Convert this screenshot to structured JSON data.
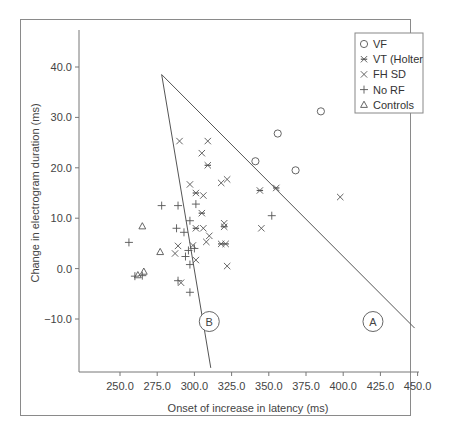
{
  "chart_data": {
    "type": "scatter",
    "title": "",
    "xlabel": "Onset of increase in latency (ms)",
    "ylabel": "Change in electrogram duration (ms)",
    "xlim": [
      222.5,
      450
    ],
    "ylim": [
      -20,
      47
    ],
    "x_ticks": [
      "250.0",
      "275.0",
      "300.0",
      "325.0",
      "350.0",
      "375.0",
      "400.0",
      "425.0",
      "450.0"
    ],
    "y_ticks": [
      "40.0",
      "30.0",
      "20.0",
      "10.0",
      "0.0",
      "-10.0"
    ],
    "grid": false,
    "legend_position": "upper right",
    "legend": [
      "VF",
      "VT (Holter",
      "FH SD",
      "No RF",
      "Controls"
    ],
    "series": [
      {
        "name": "VF",
        "marker": "circle",
        "points": [
          [
            341,
            21.3
          ],
          [
            356,
            26.8
          ],
          [
            368,
            19.5
          ],
          [
            385,
            31.2
          ]
        ]
      },
      {
        "name": "VT (Holter",
        "marker": "asterisk-x",
        "points": [
          [
            309,
            20.5
          ],
          [
            301,
            15.0
          ],
          [
            305,
            11.0
          ],
          [
            301,
            8.0
          ],
          [
            320,
            8.3
          ],
          [
            318,
            4.9
          ],
          [
            321,
            4.9
          ],
          [
            344,
            15.5
          ],
          [
            355,
            16.0
          ]
        ]
      },
      {
        "name": "FH SD",
        "marker": "x",
        "points": [
          [
            290,
            25.3
          ],
          [
            309,
            25.3
          ],
          [
            305,
            22.9
          ],
          [
            297,
            16.7
          ],
          [
            306,
            14.5
          ],
          [
            318,
            17.0
          ],
          [
            322,
            17.7
          ],
          [
            289,
            4.5
          ],
          [
            287,
            3.0
          ],
          [
            291,
            -2.8
          ],
          [
            299,
            4.6
          ],
          [
            301,
            1.7
          ],
          [
            308,
            5.3
          ],
          [
            310,
            6.5
          ],
          [
            320,
            9.0
          ],
          [
            322,
            0.5
          ],
          [
            345,
            8.0
          ],
          [
            398,
            14.2
          ],
          [
            306,
            8.0
          ]
        ]
      },
      {
        "name": "No RF",
        "marker": "plus",
        "points": [
          [
            256,
            5.2
          ],
          [
            260,
            -1.5
          ],
          [
            278,
            12.5
          ],
          [
            289,
            12.5
          ],
          [
            293,
            7.2
          ],
          [
            288,
            8.0
          ],
          [
            297,
            9.5
          ],
          [
            296,
            3.6
          ],
          [
            294,
            2.4
          ],
          [
            297,
            0.8
          ],
          [
            300,
            4.0
          ],
          [
            289,
            -2.4
          ],
          [
            297,
            -4.7
          ],
          [
            265,
            -1.4
          ],
          [
            352,
            10.5
          ],
          [
            301,
            12.8
          ]
        ]
      },
      {
        "name": "Controls",
        "marker": "triangle",
        "points": [
          [
            265,
            8.4
          ],
          [
            277,
            3.3
          ],
          [
            262,
            -1.3
          ],
          [
            266,
            -0.6
          ]
        ]
      }
    ],
    "lines": [
      {
        "name": "A",
        "from": [
          278,
          38.5
        ],
        "to": [
          448,
          -11.8
        ]
      },
      {
        "name": "B",
        "from": [
          278,
          38.5
        ],
        "to": [
          311,
          -19.7
        ]
      }
    ],
    "annotations": [
      {
        "label": "A",
        "x": 420,
        "y": -10.5
      },
      {
        "label": "B",
        "x": 310,
        "y": -10.5
      }
    ]
  }
}
